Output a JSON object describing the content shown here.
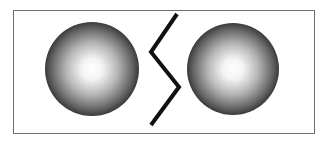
{
  "diagram": {
    "frame": {
      "x": 13,
      "y": 10,
      "width": 302,
      "height": 124,
      "border_color": "#6e6e6e"
    },
    "spheres": [
      {
        "name": "left-sphere",
        "cx": 92,
        "cy": 69,
        "r": 47,
        "highlight_color": "#ffffff",
        "edge_color": "#3a3a3a"
      },
      {
        "name": "right-sphere",
        "cx": 233,
        "cy": 69,
        "r": 46,
        "highlight_color": "#ffffff",
        "edge_color": "#3a3a3a"
      }
    ],
    "zigzag": {
      "points": "177,14 151,52 179,87 151,125",
      "stroke_color": "#111111",
      "stroke_width": 4
    }
  }
}
